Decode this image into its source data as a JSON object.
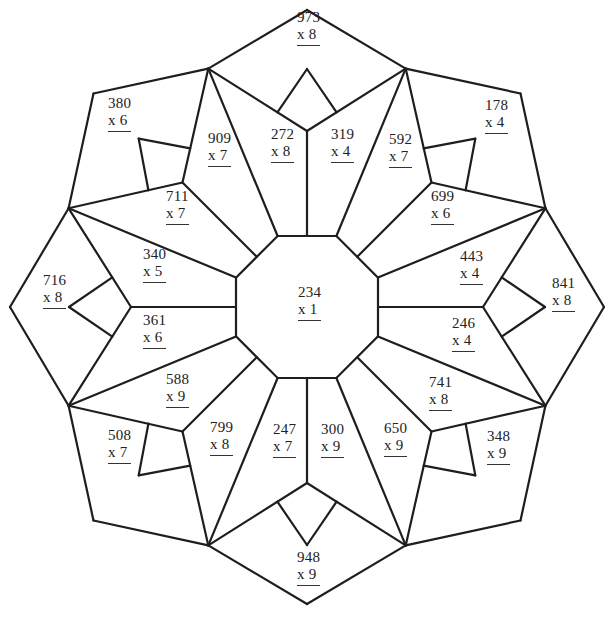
{
  "worksheet": {
    "title": "Multiplication coloring mandala",
    "colors": {
      "line": "#1e1e1e",
      "text": "#222222",
      "background": "#ffffff"
    },
    "center_label": {
      "number": "234",
      "multiplier": "x 1",
      "x": 298,
      "y": 284
    },
    "problems": [
      {
        "id": "top-kite",
        "number": "973",
        "multiplier": "x 8",
        "x": 297,
        "y": 9
      },
      {
        "id": "top-left-pentagon",
        "number": "380",
        "multiplier": "x 6",
        "x": 108,
        "y": 95
      },
      {
        "id": "top-right-pentagon",
        "number": "178",
        "multiplier": "x 4",
        "x": 485,
        "y": 97
      },
      {
        "id": "petal-909",
        "number": "909",
        "multiplier": "x 7",
        "x": 208,
        "y": 130
      },
      {
        "id": "petal-272",
        "number": "272",
        "multiplier": "x 8",
        "x": 271,
        "y": 126
      },
      {
        "id": "petal-319",
        "number": "319",
        "multiplier": "x 4",
        "x": 331,
        "y": 126
      },
      {
        "id": "petal-592",
        "number": "592",
        "multiplier": "x 7",
        "x": 389,
        "y": 131
      },
      {
        "id": "petal-711",
        "number": "711",
        "multiplier": "x 7",
        "x": 166,
        "y": 188
      },
      {
        "id": "petal-699",
        "number": "699",
        "multiplier": "x 6",
        "x": 431,
        "y": 188
      },
      {
        "id": "petal-340",
        "number": "340",
        "multiplier": "x 5",
        "x": 143,
        "y": 246
      },
      {
        "id": "petal-443",
        "number": "443",
        "multiplier": "x 4",
        "x": 460,
        "y": 248
      },
      {
        "id": "left-kite",
        "number": "716",
        "multiplier": "x 8",
        "x": 43,
        "y": 272
      },
      {
        "id": "right-kite",
        "number": "841",
        "multiplier": "x 8",
        "x": 552,
        "y": 275
      },
      {
        "id": "petal-361",
        "number": "361",
        "multiplier": "x 6",
        "x": 143,
        "y": 312
      },
      {
        "id": "petal-246",
        "number": "246",
        "multiplier": "x 4",
        "x": 452,
        "y": 315
      },
      {
        "id": "petal-588",
        "number": "588",
        "multiplier": "x 9",
        "x": 166,
        "y": 371
      },
      {
        "id": "petal-741",
        "number": "741",
        "multiplier": "x 8",
        "x": 429,
        "y": 374
      },
      {
        "id": "bottom-left-pentagon",
        "number": "508",
        "multiplier": "x 7",
        "x": 108,
        "y": 427
      },
      {
        "id": "petal-799",
        "number": "799",
        "multiplier": "x 8",
        "x": 210,
        "y": 419
      },
      {
        "id": "petal-247",
        "number": "247",
        "multiplier": "x 7",
        "x": 273,
        "y": 421
      },
      {
        "id": "petal-300",
        "number": "300",
        "multiplier": "x 9",
        "x": 321,
        "y": 421
      },
      {
        "id": "petal-650",
        "number": "650",
        "multiplier": "x 9",
        "x": 384,
        "y": 420
      },
      {
        "id": "bottom-right-pentagon",
        "number": "348",
        "multiplier": "x 9",
        "x": 487,
        "y": 428
      },
      {
        "id": "bottom-kite",
        "number": "948",
        "multiplier": "x 9",
        "x": 297,
        "y": 549
      }
    ]
  }
}
